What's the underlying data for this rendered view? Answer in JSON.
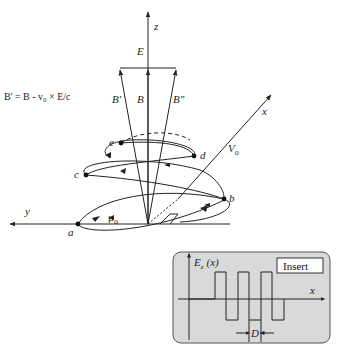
{
  "diagram": {
    "formula": "B' = B - v₀ × E/c",
    "axes": {
      "z": "z",
      "x": "x",
      "y": "y"
    },
    "vectors": {
      "E": "E",
      "B_prime": "B'",
      "B": "B",
      "B_double_prime": "B\"",
      "V0": "V",
      "V0_sub": "o",
      "mu0": "μ",
      "mu0_sub": "o"
    },
    "points": [
      "a",
      "b",
      "c",
      "d",
      "e"
    ]
  },
  "insert": {
    "title": "Insert",
    "y_label": "E",
    "y_label_sub": "z",
    "y_label_arg": "(x)",
    "x_label": "x",
    "period_label": "D",
    "colors": {
      "background": "#d9d9d9",
      "border": "#555555"
    }
  }
}
